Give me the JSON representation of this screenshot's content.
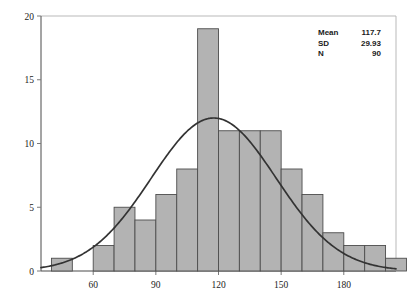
{
  "chart_data": {
    "type": "bar",
    "title": "",
    "subtitle": "",
    "xlabel": "",
    "ylabel": "",
    "xlim": [
      35,
      205
    ],
    "ylim": [
      0,
      20
    ],
    "grid": false,
    "bin_width": 10,
    "categories": [
      "40",
      "50",
      "60",
      "70",
      "80",
      "90",
      "100",
      "110",
      "120",
      "130",
      "140",
      "150",
      "160",
      "170",
      "180",
      "190",
      "200"
    ],
    "bin_starts": [
      40,
      50,
      60,
      70,
      80,
      90,
      100,
      110,
      120,
      130,
      140,
      150,
      160,
      170,
      180,
      190,
      200
    ],
    "values": [
      1,
      0,
      2,
      5,
      4,
      6,
      8,
      19,
      11,
      11,
      11,
      8,
      6,
      3,
      2,
      2,
      1
    ],
    "xticks": [
      60,
      90,
      120,
      150,
      180
    ],
    "xtick_labels": [
      "60",
      "90",
      "120",
      "150",
      "180"
    ],
    "yticks": [
      0,
      5,
      10,
      15,
      20
    ],
    "ytick_labels": [
      "0",
      "5",
      "10",
      "15",
      "20"
    ],
    "overlay": {
      "type": "line",
      "name": "normal-curve",
      "mean": 117.7,
      "sd": 29.93,
      "peak_y": 12.0,
      "color": "#333333"
    },
    "legend_position": "top-right",
    "bar_color": "#b3b3b3",
    "bar_edge_color": "#4d4d4d"
  },
  "stats": {
    "rows": [
      {
        "label": "Mean",
        "value": "117.7"
      },
      {
        "label": "SD",
        "value": "29.93"
      },
      {
        "label": "N",
        "value": "90"
      }
    ]
  }
}
